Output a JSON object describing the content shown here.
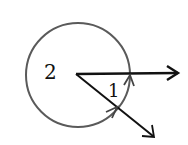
{
  "diagram": {
    "type": "angle-diagram",
    "labels": {
      "angle_small": "1",
      "angle_reflex": "2"
    },
    "colors": {
      "rays": "#111111",
      "circle": "#555555",
      "text": "#111111",
      "background": "#ffffff"
    },
    "geometry": {
      "vertex": [
        76,
        74
      ],
      "circle_center": [
        78,
        75
      ],
      "circle_radius": 52,
      "ray_horizontal_end": [
        179,
        73
      ],
      "ray_diagonal_end": [
        154,
        137
      ]
    }
  }
}
